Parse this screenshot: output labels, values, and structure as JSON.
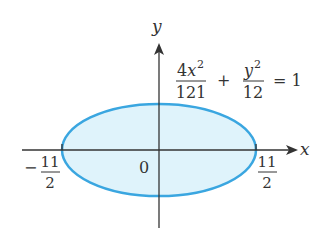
{
  "figure": {
    "type": "ellipse-graph",
    "equation": {
      "term1_numerator": "4x",
      "term1_numerator_exp": "2",
      "term1_denominator": "121",
      "operator": "+",
      "term2_numerator": "y",
      "term2_numerator_exp": "2",
      "term2_denominator": "12",
      "equals": "= 1"
    },
    "axes": {
      "x_label": "x",
      "y_label": "y",
      "origin_label": "0"
    },
    "intercepts": {
      "left": {
        "sign": "−",
        "numerator": "11",
        "denominator": "2",
        "value": -5.5
      },
      "right": {
        "numerator": "11",
        "denominator": "2",
        "value": 5.5
      }
    },
    "ellipse": {
      "semi_major_x": 5.5,
      "semi_minor_y": 3.4641,
      "stroke_color": "#3aa6e0",
      "fill_color": "#dff3fb"
    },
    "axis_color": "#333333"
  }
}
